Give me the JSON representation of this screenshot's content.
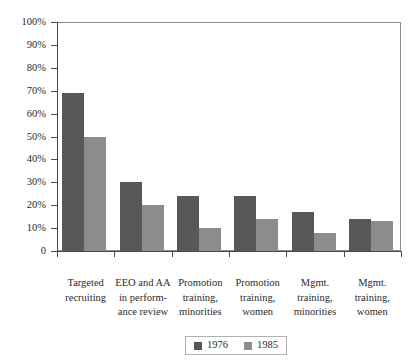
{
  "chart_data": {
    "type": "bar",
    "title": "",
    "subtitle": "",
    "xlabel": "",
    "ylabel": "",
    "ylim": [
      0,
      100
    ],
    "ytick_labels": [
      "100%",
      "90%",
      "80%",
      "70%",
      "60%",
      "50%",
      "40%",
      "30%",
      "20%",
      "10%",
      "0"
    ],
    "ytick_values": [
      100,
      90,
      80,
      70,
      60,
      50,
      40,
      30,
      20,
      10,
      0
    ],
    "grid": false,
    "legend_position": "bottom-center",
    "categories": [
      "Targeted recruiting",
      "EEO and AA in perform-ance review",
      "Promotion training, minorities",
      "Promotion training, women",
      "Mgmt. training, minorities",
      "Mgmt. training, women"
    ],
    "category_lines": [
      [
        "Targeted",
        "recruiting"
      ],
      [
        "EEO and AA",
        "in perform-",
        "ance review"
      ],
      [
        "Promotion",
        "training,",
        "minorities"
      ],
      [
        "Promotion",
        "training,",
        "women"
      ],
      [
        "Mgmt.",
        "training,",
        "minorities"
      ],
      [
        "Mgmt.",
        "training,",
        "women"
      ]
    ],
    "series": [
      {
        "name": "1976",
        "color": "#585858",
        "values": [
          69,
          30,
          24,
          24,
          17,
          14
        ]
      },
      {
        "name": "1985",
        "color": "#8c8c8c",
        "values": [
          50,
          20,
          10,
          14,
          8,
          13
        ]
      }
    ]
  },
  "legend": {
    "items": [
      {
        "label": "1976",
        "color": "#585858"
      },
      {
        "label": "1985",
        "color": "#8c8c8c"
      }
    ]
  }
}
